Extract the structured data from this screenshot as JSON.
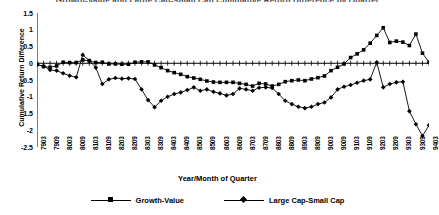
{
  "chart_data": {
    "type": "line",
    "title": "Growth-Value and Large Cap-Small Cap Cumulative Return Difference by Quarter",
    "xlabel": "Year/Month of Quarter",
    "ylabel": "Cumulative Return Difference",
    "ylim": [
      -2.5,
      1.5
    ],
    "yticks": [
      1.5,
      1,
      0.5,
      0,
      -0.5,
      -1,
      -1.5,
      -2,
      -2.5
    ],
    "ytick_labels": [
      "1.5",
      "1",
      "0.5",
      "0",
      "-0.5",
      "-1",
      "-1.5",
      "-2",
      "-2.5"
    ],
    "grid": false,
    "legend_position": "bottom",
    "x": [
      "7903",
      "7906",
      "7909",
      "7912",
      "8003",
      "8006",
      "8009",
      "8012",
      "8103",
      "8106",
      "8109",
      "8112",
      "8203",
      "8206",
      "8209",
      "8212",
      "8303",
      "8306",
      "8309",
      "8312",
      "8403",
      "8406",
      "8409",
      "8412",
      "8503",
      "8506",
      "8509",
      "8512",
      "8603",
      "8606",
      "8609",
      "8612",
      "8703",
      "8706",
      "8709",
      "8712",
      "8803",
      "8806",
      "8809",
      "8812",
      "8903",
      "8906",
      "8909",
      "8912",
      "9003",
      "9006",
      "9009",
      "9012",
      "9103",
      "9106",
      "9109",
      "9112",
      "9203",
      "9206",
      "9209",
      "9212",
      "9303",
      "9306",
      "9309",
      "9312",
      "9403"
    ],
    "xtick_labels": [
      "7903",
      "7909",
      "8003",
      "8009",
      "8103",
      "8109",
      "8203",
      "8209",
      "8303",
      "8309",
      "8403",
      "8409",
      "8503",
      "8509",
      "8603",
      "8609",
      "8703",
      "8709",
      "8803",
      "8809",
      "8903",
      "8909",
      "9003",
      "9009",
      "9103",
      "9109",
      "9203",
      "9209",
      "9303",
      "9309",
      "9403"
    ],
    "xtick_step": 2,
    "series": [
      {
        "name": "Growth-Value",
        "marker": "square",
        "color": "#000000",
        "values": [
          -0.03,
          -0.1,
          -0.12,
          -0.08,
          0.03,
          0.02,
          0.02,
          0.1,
          0.07,
          0.02,
          0.03,
          -0.02,
          -0.02,
          -0.03,
          -0.03,
          0.03,
          0.04,
          0.04,
          -0.05,
          -0.13,
          -0.22,
          -0.28,
          -0.33,
          -0.4,
          -0.44,
          -0.48,
          -0.53,
          -0.56,
          -0.57,
          -0.57,
          -0.57,
          -0.6,
          -0.63,
          -0.68,
          -0.6,
          -0.62,
          -0.68,
          -0.63,
          -0.55,
          -0.52,
          -0.5,
          -0.52,
          -0.47,
          -0.43,
          -0.38,
          -0.22,
          -0.12,
          -0.02,
          0.17,
          0.28,
          0.4,
          0.6,
          0.83,
          1.06,
          0.62,
          0.66,
          0.63,
          0.53,
          0.87,
          0.3,
          0.03
        ]
      },
      {
        "name": "Large Cap-Small Cap",
        "marker": "diamond",
        "color": "#000000",
        "values": [
          -0.05,
          -0.08,
          -0.2,
          -0.22,
          -0.3,
          -0.37,
          -0.42,
          0.25,
          0.08,
          -0.13,
          -0.62,
          -0.48,
          -0.44,
          -0.46,
          -0.45,
          -0.47,
          -0.78,
          -1.1,
          -1.31,
          -1.12,
          -1.0,
          -0.92,
          -0.87,
          -0.8,
          -0.72,
          -0.82,
          -0.78,
          -0.85,
          -0.9,
          -0.96,
          -0.92,
          -0.75,
          -0.78,
          -0.82,
          -0.73,
          -0.72,
          -0.74,
          -0.92,
          -1.12,
          -1.22,
          -1.3,
          -1.34,
          -1.3,
          -1.22,
          -1.17,
          -1.02,
          -0.78,
          -0.7,
          -0.65,
          -0.58,
          -0.52,
          -0.48,
          0.03,
          -0.72,
          -0.62,
          -0.57,
          -0.55,
          -1.43,
          -1.82,
          -2.17,
          -1.85
        ]
      }
    ]
  },
  "legend": {
    "items": [
      {
        "label": "Growth-Value",
        "marker": "square"
      },
      {
        "label": "Large Cap-Small Cap",
        "marker": "diamond"
      }
    ]
  }
}
